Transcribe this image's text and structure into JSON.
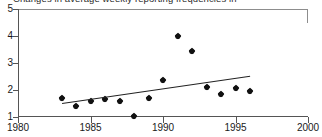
{
  "chart_data": {
    "type": "scatter",
    "title": "Changes in average weekly reporting frequencies in",
    "xlabel": "",
    "ylabel": "",
    "xlim": [
      1980,
      2000
    ],
    "ylim": [
      1,
      5
    ],
    "grid": false,
    "legend": "none",
    "xticks": [
      "1980",
      "1985",
      "1990",
      "1995",
      "2000"
    ],
    "xtick_values": [
      1980,
      1985,
      1990,
      1995,
      2000
    ],
    "yticks": [
      "1",
      "2",
      "3",
      "4",
      "5"
    ],
    "ytick_values": [
      1,
      2,
      3,
      4,
      5
    ],
    "x": [
      1983,
      1984,
      1985,
      1986,
      1987,
      1988,
      1989,
      1990,
      1991,
      1992,
      1993,
      1994,
      1995,
      1996
    ],
    "values": [
      1.72,
      1.41,
      1.6,
      1.68,
      1.58,
      1.04,
      1.69,
      2.38,
      4.0,
      3.45,
      2.1,
      1.84,
      2.08,
      1.98
    ],
    "series": [
      {
        "name": "Average weekly reporting frequency",
        "marker": "diamond",
        "color": "#111111",
        "x": [
          1983,
          1984,
          1985,
          1986,
          1987,
          1988,
          1989,
          1990,
          1991,
          1992,
          1993,
          1994,
          1995,
          1996
        ],
        "values": [
          1.72,
          1.41,
          1.6,
          1.68,
          1.58,
          1.04,
          1.69,
          2.38,
          4.0,
          3.45,
          2.1,
          1.84,
          2.08,
          1.98
        ]
      },
      {
        "name": "Linear trend",
        "type": "line",
        "color": "#222222",
        "x": [
          1983,
          1996
        ],
        "values": [
          1.52,
          2.53
        ]
      }
    ],
    "annotations": []
  },
  "axes": {
    "x_min_label": "1980",
    "x_max_label": "2000",
    "y_min_label": "1",
    "y_max_label": "5"
  }
}
